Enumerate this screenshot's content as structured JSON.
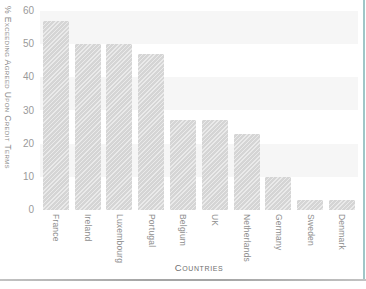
{
  "chart_data": {
    "type": "bar",
    "title": "",
    "xlabel": "Countries",
    "ylabel": "% Exceeding Agreed Upon Credit Terms",
    "categories": [
      "France",
      "Ireland",
      "Luxembourg",
      "Portugal",
      "Belgium",
      "UK",
      "Netherlands",
      "Germany",
      "Sweden",
      "Denmark"
    ],
    "values": [
      57,
      50,
      50,
      47,
      27,
      27,
      23,
      10,
      3,
      3
    ],
    "ylim": [
      0,
      60
    ],
    "yticks": [
      0,
      10,
      20,
      30,
      40,
      50,
      60
    ],
    "legend": "none",
    "grid": "alternating horizontal bands between gridlines",
    "band_values": [
      60,
      40,
      20
    ],
    "colors": {
      "bar_fill": "#d9d9d9",
      "band_fill": "#f6f6f6",
      "tick_text": "#9a9a9a",
      "axis_title_text": "#8a8a8a",
      "bottom_rule": "#a5a5a5",
      "right_accent": "#9fc6c7",
      "background": "#ffffff"
    }
  }
}
